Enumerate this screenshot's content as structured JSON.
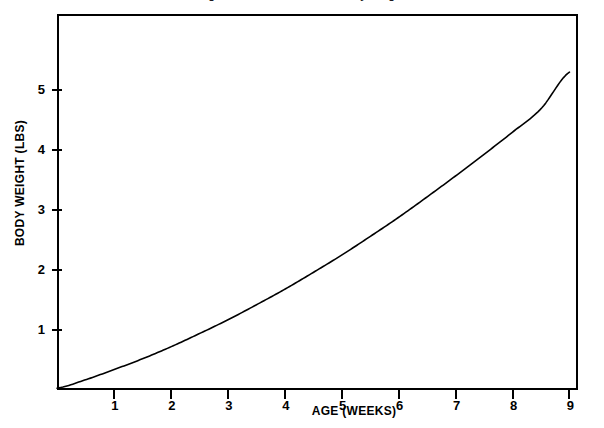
{
  "figure": {
    "name": "growth-curve-figure",
    "background_color": "#ffffff",
    "ink_color": "#000000",
    "title_clipped": "Figure 1. Growth curve of body weight",
    "frame": {
      "left": 57,
      "top": 14,
      "right": 578,
      "bottom": 390
    }
  },
  "chart_data": {
    "type": "line",
    "title": "",
    "xlabel": "AGE (WEEKS)",
    "ylabel": "BODY WEIGHT (LBS)",
    "xlim": [
      0,
      9.15
    ],
    "ylim": [
      0,
      6.27
    ],
    "xticks": [
      1,
      2,
      3,
      4,
      5,
      6,
      7,
      8,
      9
    ],
    "xticklabels": [
      "1",
      "2",
      "3",
      "4",
      "5",
      "6",
      "7",
      "8",
      "9"
    ],
    "yticks": [
      1,
      2,
      3,
      4,
      5
    ],
    "yticklabels": [
      "1",
      "2",
      "3",
      "4",
      "5"
    ],
    "grid": false,
    "legend": null,
    "series": [
      {
        "name": "body weight",
        "color": "#000000",
        "line_width": 1.6,
        "x": [
          0,
          0.5,
          1,
          1.5,
          2,
          2.5,
          3,
          3.5,
          4,
          4.5,
          5,
          5.5,
          6,
          6.5,
          7,
          7.5,
          8,
          8.5,
          9
        ],
        "y": [
          0.03,
          0.17,
          0.34,
          0.52,
          0.72,
          0.94,
          1.17,
          1.42,
          1.68,
          1.96,
          2.25,
          2.56,
          2.88,
          3.22,
          3.57,
          3.93,
          4.3,
          4.69,
          5.3
        ]
      }
    ]
  }
}
